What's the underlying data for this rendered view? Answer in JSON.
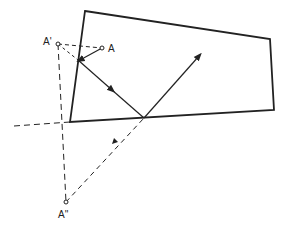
{
  "diagram": {
    "labels": {
      "source": "A",
      "first_image": "A'",
      "second_image": "A''"
    },
    "colors": {
      "ink": "#222222",
      "background": "#ffffff"
    }
  }
}
